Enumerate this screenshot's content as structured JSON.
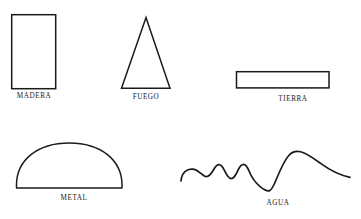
{
  "page": {
    "background_color": "#ffffff",
    "ink_color": "#1a1a1a"
  },
  "diagram": {
    "type": "element-shape-chart",
    "caption_color": "#191919",
    "stroke_color": "#1a1a1a",
    "stroke_width": 1.4,
    "elements": [
      {
        "id": "madera",
        "label": "MADERA",
        "shape": "vertical-rectangle",
        "geometry": {
          "x": 11,
          "y": 14,
          "width": 45,
          "height": 75
        }
      },
      {
        "id": "fuego",
        "label": "FUEGO",
        "shape": "triangle",
        "geometry": {
          "apex_x": 146,
          "apex_y": 17,
          "base_left_x": 121,
          "base_right_x": 170,
          "base_y": 89
        }
      },
      {
        "id": "tierra",
        "label": "TIERRA",
        "shape": "horizontal-rectangle",
        "geometry": {
          "x": 236,
          "y": 71,
          "width": 93,
          "height": 17
        }
      },
      {
        "id": "metal",
        "label": "METAL",
        "shape": "dome-semi-ellipse",
        "geometry": {
          "left_x": 16,
          "right_x": 122,
          "base_y": 188,
          "peak_y": 143
        }
      },
      {
        "id": "agua",
        "label": "AGUA",
        "shape": "wave-curve",
        "geometry": {
          "start_x": 181,
          "start_y": 181,
          "end_x": 350,
          "end_y": 177,
          "peak_y": 152,
          "trough_y": 190
        }
      }
    ]
  }
}
